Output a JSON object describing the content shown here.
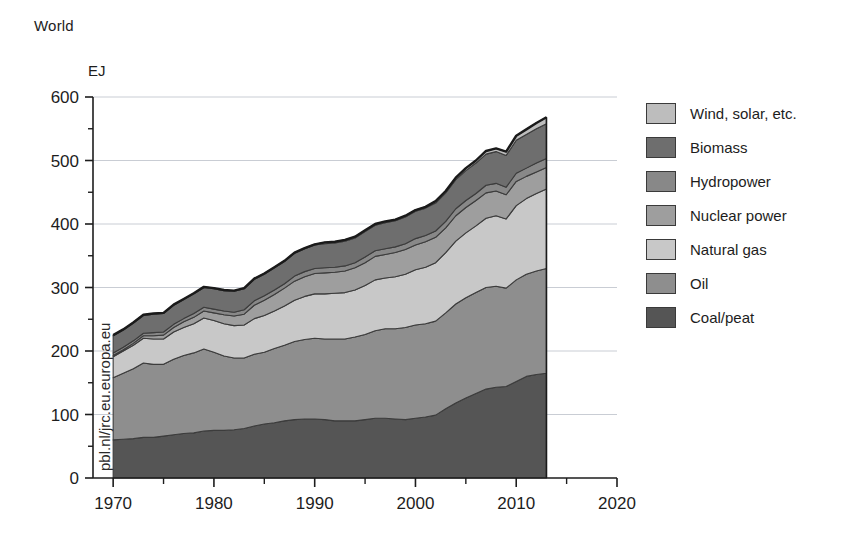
{
  "chart_data": {
    "type": "area",
    "stacked": true,
    "title": "World",
    "subtitle": "",
    "xlabel": "",
    "ylabel": "EJ",
    "ylim": [
      0,
      600
    ],
    "xlim": [
      1968,
      2020
    ],
    "yticks": [
      0,
      100,
      200,
      300,
      400,
      500,
      600
    ],
    "ytick_labels": [
      "0",
      "100",
      "200",
      "300",
      "400",
      "500",
      "600"
    ],
    "y_minor_step": 50,
    "xticks": [
      1970,
      1980,
      1990,
      2000,
      2010,
      2020
    ],
    "xtick_labels": [
      "1970",
      "1980",
      "1990",
      "2000",
      "2010",
      "2020"
    ],
    "x_minor_step": 5,
    "grid": "horizontal",
    "legend_position": "right",
    "watermark": "pbl.nl/jrc.eu.europa.eu",
    "x": [
      1970,
      1971,
      1972,
      1973,
      1974,
      1975,
      1976,
      1977,
      1978,
      1979,
      1980,
      1981,
      1982,
      1983,
      1984,
      1985,
      1986,
      1987,
      1988,
      1989,
      1990,
      1991,
      1992,
      1993,
      1994,
      1995,
      1996,
      1997,
      1998,
      1999,
      2000,
      2001,
      2002,
      2003,
      2004,
      2005,
      2006,
      2007,
      2008,
      2009,
      2010,
      2011,
      2012,
      2013
    ],
    "series": [
      {
        "name": "Coal/peat",
        "color": "#555555",
        "values": [
          60,
          61,
          62,
          64,
          64,
          66,
          68,
          70,
          71,
          74,
          75,
          75,
          76,
          78,
          82,
          85,
          87,
          90,
          92,
          93,
          93,
          92,
          90,
          90,
          90,
          92,
          94,
          94,
          93,
          92,
          94,
          96,
          99,
          109,
          118,
          126,
          133,
          140,
          143,
          144,
          152,
          160,
          163,
          165
        ]
      },
      {
        "name": "Oil",
        "color": "#8e8e8e",
        "values": [
          98,
          104,
          110,
          117,
          115,
          113,
          119,
          123,
          126,
          129,
          123,
          117,
          113,
          111,
          113,
          113,
          117,
          119,
          123,
          125,
          127,
          127,
          129,
          129,
          132,
          134,
          138,
          141,
          142,
          145,
          147,
          147,
          148,
          151,
          156,
          158,
          159,
          160,
          159,
          155,
          160,
          161,
          163,
          165
        ]
      },
      {
        "name": "Natural gas",
        "color": "#c8c8c8",
        "values": [
          33,
          35,
          37,
          39,
          40,
          40,
          43,
          44,
          46,
          49,
          50,
          51,
          51,
          52,
          56,
          58,
          59,
          62,
          65,
          68,
          70,
          71,
          72,
          73,
          74,
          77,
          80,
          80,
          82,
          84,
          87,
          89,
          92,
          95,
          99,
          102,
          105,
          109,
          111,
          109,
          117,
          119,
          122,
          125
        ]
      },
      {
        "name": "Nuclear power",
        "color": "#9e9e9e",
        "values": [
          2,
          2,
          3,
          4,
          5,
          6,
          7,
          9,
          10,
          11,
          12,
          14,
          15,
          17,
          21,
          24,
          26,
          28,
          30,
          31,
          32,
          33,
          33,
          34,
          35,
          36,
          37,
          37,
          38,
          39,
          39,
          40,
          40,
          39,
          40,
          40,
          40,
          40,
          39,
          38,
          38,
          35,
          34,
          34
        ]
      },
      {
        "name": "Hydropower",
        "color": "#888888",
        "values": [
          4,
          4,
          4,
          4,
          5,
          5,
          5,
          5,
          6,
          6,
          6,
          6,
          6,
          7,
          7,
          7,
          7,
          7,
          8,
          8,
          8,
          8,
          8,
          8,
          8,
          9,
          9,
          9,
          9,
          9,
          10,
          10,
          10,
          10,
          11,
          11,
          11,
          12,
          12,
          12,
          13,
          13,
          14,
          14
        ]
      },
      {
        "name": "Biomass",
        "color": "#6e6e6e",
        "values": [
          27,
          27,
          28,
          28,
          29,
          29,
          30,
          30,
          31,
          31,
          32,
          32,
          33,
          33,
          34,
          34,
          35,
          35,
          36,
          36,
          37,
          38,
          38,
          39,
          39,
          40,
          40,
          41,
          41,
          42,
          43,
          43,
          44,
          45,
          46,
          47,
          48,
          49,
          50,
          50,
          52,
          53,
          54,
          55
        ]
      },
      {
        "name": "Wind, solar, etc.",
        "color": "#bdbdbd",
        "values": [
          1,
          1,
          1,
          1,
          1,
          1,
          1,
          1,
          1,
          1,
          1,
          1,
          1,
          1,
          1,
          1,
          1,
          1,
          1,
          1,
          1,
          2,
          2,
          2,
          2,
          2,
          2,
          2,
          2,
          2,
          2,
          2,
          3,
          3,
          3,
          4,
          4,
          5,
          5,
          6,
          7,
          8,
          9,
          10
        ]
      }
    ],
    "legend_order": [
      "Wind, solar, etc.",
      "Biomass",
      "Hydropower",
      "Nuclear power",
      "Natural gas",
      "Oil",
      "Coal/peat"
    ]
  },
  "legend": {
    "items": [
      {
        "label": "Wind, solar, etc.",
        "color": "#bdbdbd"
      },
      {
        "label": "Biomass",
        "color": "#6e6e6e"
      },
      {
        "label": "Hydropower",
        "color": "#888888"
      },
      {
        "label": "Nuclear power",
        "color": "#9e9e9e"
      },
      {
        "label": "Natural gas",
        "color": "#c8c8c8"
      },
      {
        "label": "Oil",
        "color": "#8e8e8e"
      },
      {
        "label": "Coal/peat",
        "color": "#555555"
      }
    ]
  },
  "style": {
    "axis_color": "#1d1d1d",
    "grid_color": "#c9cdd4",
    "outline_color": "#1a1a1a",
    "background": "#ffffff"
  }
}
